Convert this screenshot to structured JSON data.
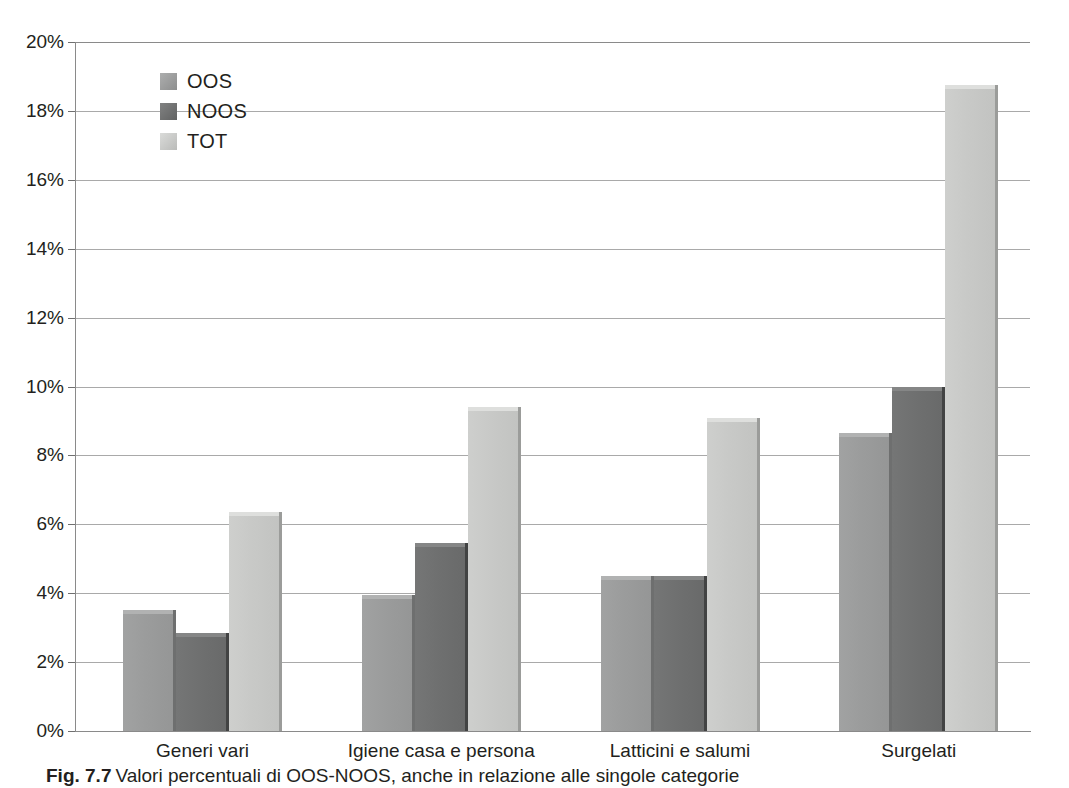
{
  "chart_data": {
    "type": "bar",
    "title": "",
    "xlabel": "",
    "ylabel": "",
    "ylim": [
      0,
      20
    ],
    "ytick_labels": [
      "20%",
      "18%",
      "16%",
      "14%",
      "12%",
      "10%",
      "8%",
      "6%",
      "4%",
      "2%",
      "0%"
    ],
    "ytick_values": [
      20,
      18,
      16,
      14,
      12,
      10,
      8,
      6,
      4,
      2,
      0
    ],
    "grid": true,
    "legend_position": "upper-left-inside",
    "categories": [
      "Generi vari",
      "Igiene casa e persona",
      "Latticini e salumi",
      "Surgelati"
    ],
    "series": [
      {
        "name": "OOS",
        "color": "#9b9c9c",
        "values": [
          3.5,
          3.95,
          4.5,
          8.65
        ]
      },
      {
        "name": "NOOS",
        "color": "#6f7070",
        "values": [
          2.85,
          5.45,
          4.5,
          10.0
        ]
      },
      {
        "name": "TOT",
        "color": "#c8c9c7",
        "values": [
          6.35,
          9.4,
          9.1,
          18.75
        ]
      }
    ],
    "value_unit": "%"
  },
  "legend": {
    "items": [
      {
        "label": "OOS"
      },
      {
        "label": "NOOS"
      },
      {
        "label": "TOT"
      }
    ]
  },
  "caption": {
    "figure_number": "Fig. 7.7",
    "text": "Valori percentuali di OOS-NOOS, anche in relazione alle singole categorie"
  },
  "colors": {
    "oos": "#9b9c9c",
    "noos": "#6f7070",
    "tot": "#c8c9c7",
    "gridline": "#a9a9a9",
    "axis": "#8a8a8a",
    "text": "#231f20"
  }
}
